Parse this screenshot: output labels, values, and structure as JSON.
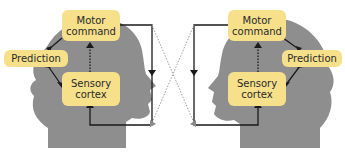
{
  "left_head": {
    "motor": "Motor\ncommand",
    "prediction": "Prediction",
    "sensory": "Sensory\ncortex"
  },
  "right_head": {
    "motor": "Motor\ncommand",
    "prediction": "Prediction",
    "sensory": "Sensory\ncortex"
  },
  "colors": {
    "box_fill": "#f6e08a",
    "head_fill": "#8e8e8e",
    "arrow": "#1a1a1a",
    "dotted": "#a0a0a0"
  }
}
